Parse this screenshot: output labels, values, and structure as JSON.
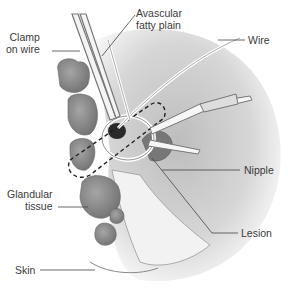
{
  "diagram": {
    "labels": {
      "clamp": [
        "Clamp",
        "on wire"
      ],
      "avascular": [
        "Avascular",
        "fatty plain"
      ],
      "wire": "Wire",
      "nipple": "Nipple",
      "glandular": [
        "Glandular",
        "tissue"
      ],
      "lesion": "Lesion",
      "skin": "Skin"
    },
    "colors": {
      "background": "#ffffff",
      "breast_shade": "#d9d9d9",
      "gland": "#8c8c8c",
      "lesion": "#2a2a2a",
      "leader_line": "#444444",
      "text": "#3a3a3a"
    }
  }
}
